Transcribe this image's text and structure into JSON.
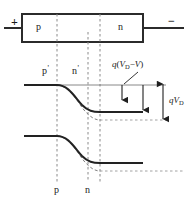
{
  "figure": {
    "type": "semiconductor-pn-junction-energy-band-diagram",
    "device": {
      "region_left_label": "p",
      "region_right_label": "n",
      "terminal_left_sign": "+",
      "terminal_right_sign": "−"
    },
    "band_labels": {
      "upper_left_region": "p",
      "upper_left_prime": "'",
      "upper_right_region": "n",
      "upper_right_prime": "'",
      "lower_left_region": "p",
      "lower_right_region": "n"
    },
    "annotations": {
      "applied_bias_gap": {
        "q": "q",
        "open_paren": "(",
        "V": "V",
        "V_sub": "D",
        "minus": "−",
        "V2": "V",
        "close_paren": ")",
        "text": "q(V_D−V)"
      },
      "builtin_potential": {
        "q": "q",
        "V": "V",
        "V_sub": "D",
        "text": "qV_D"
      }
    },
    "colors": {
      "ink": "#1a1a1a",
      "band": "#262626",
      "thin_line": "#555555",
      "dashed": "#777777",
      "background": "#ffffff"
    },
    "geometry": {
      "box": {
        "x": 22,
        "y": 14,
        "w": 121,
        "h": 28
      },
      "dashed_verticals_x": [
        57,
        88,
        100
      ],
      "upper_band_left_y": 85,
      "upper_band_right_y": 112,
      "lower_band_left_y": 136,
      "lower_band_right_y": 163,
      "double_arrow_x": 163,
      "double_arrow_top_y": 82,
      "double_arrow_bottom_y": 120
    }
  }
}
